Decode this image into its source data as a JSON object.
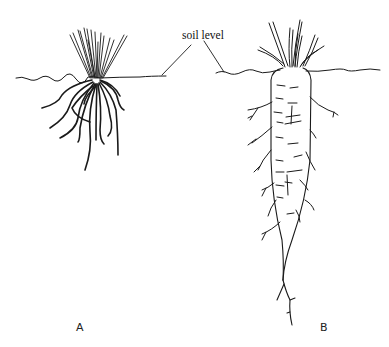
{
  "diagram": {
    "annotation": "soil level",
    "figures": [
      {
        "id": "A",
        "label": "A",
        "type": "fibrous root system"
      },
      {
        "id": "B",
        "label": "B",
        "type": "taproot system"
      }
    ],
    "colors": {
      "line": "#1a1a1a",
      "background": "#ffffff"
    }
  }
}
